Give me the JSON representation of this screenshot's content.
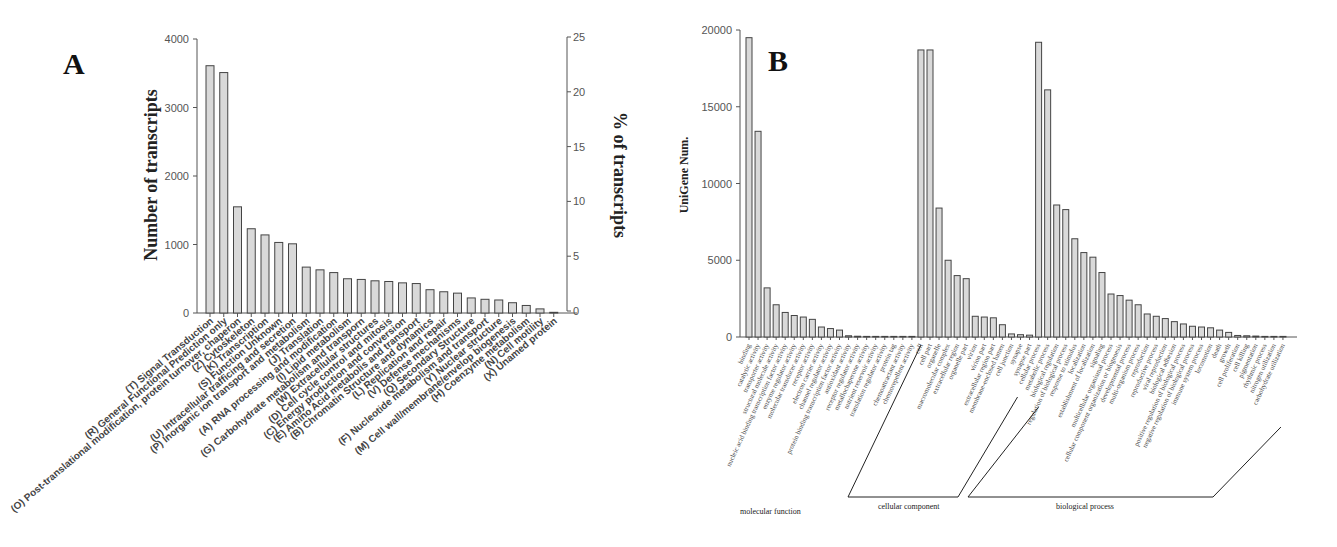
{
  "panels": {
    "a": {
      "letter": "A"
    },
    "b": {
      "letter": "B"
    }
  },
  "chart_data": [
    {
      "type": "bar",
      "panel": "A",
      "title": "",
      "xlabel": "",
      "ylabel": "Number of transcripts",
      "ylabel_right": "% of transcripts",
      "ylim": [
        0,
        4000
      ],
      "yticks": [
        0,
        1000,
        2000,
        3000,
        4000
      ],
      "ylim_right": [
        0,
        25
      ],
      "yticks_right": [
        0,
        5,
        10,
        15,
        20,
        25
      ],
      "grid": false,
      "categories": [
        "(T) Signal Transduction",
        "(R) General Functional Prediction only",
        "(O) Post-translational modification, protein turnover, chaperon",
        "(Z) Cytoskeleton",
        "(K) Transcription",
        "(S) Function Unknown",
        "(U) Intracellular trafficing and secretion",
        "(P) Inorganic ion transport and metabolism",
        "(J) Translation",
        "(A) RNA processing and modification",
        "(I) Lipid metabolism",
        "(G) Carbohydrate metabolism and transporn",
        "(W) Extracellular structures",
        "(D) Cell cycle control and mitosis",
        "(C) Energy production and conversion",
        "(E) Amino Acid metabolis and transport",
        "(B) Chromatin Structure and dynamics",
        "(L) Replication and repair",
        "(V) Defense mechanisms",
        "(Q) Secondary Structure",
        "(F) Nucleotide metabolism and transport",
        "(Y) Nuclear structure",
        "(M) Cell wall/membrane/envelop biogenesis",
        "(H) Coenzyme metabolism",
        "(N) Cell motility",
        "(X) Unamed protein"
      ],
      "values": [
        3610,
        3510,
        1550,
        1230,
        1140,
        1030,
        1010,
        670,
        630,
        590,
        500,
        490,
        470,
        460,
        440,
        430,
        340,
        310,
        290,
        220,
        200,
        190,
        150,
        110,
        60,
        10
      ]
    },
    {
      "type": "bar",
      "panel": "B",
      "title": "",
      "xlabel": "",
      "ylabel": "UniGene Num.",
      "ylim": [
        0,
        20000
      ],
      "yticks": [
        0,
        5000,
        10000,
        15000,
        20000
      ],
      "grid": false,
      "groups": [
        {
          "name": "molecular function",
          "categories": [
            "binding",
            "catalytic activity",
            "transporter activity",
            "structural molecule activity",
            "nucleic acid binding transcription factor activity",
            "enzyme regulator activity",
            "molecular transducer activity",
            "receptor activity",
            "electron carrier activity",
            "channel regulator activity",
            "protein binding transcription factor activity",
            "antioxidant activity",
            "receptor regulator activity",
            "metallochaperone activity",
            "nutrient reservoir activity",
            "translation regulator activity",
            "protein tag",
            "chemoattractant activity",
            "chemorepellent activity"
          ],
          "values": [
            19500,
            13400,
            3200,
            2100,
            1600,
            1400,
            1300,
            1150,
            650,
            550,
            450,
            80,
            50,
            10,
            10,
            10,
            10,
            5,
            5
          ]
        },
        {
          "name": "cellular component",
          "categories": [
            "cell",
            "cell part",
            "organelle",
            "macromolecular complex",
            "extracellular region",
            "organelle part",
            "virion",
            "virion part",
            "extracellular region part",
            "membrane-enclosed lumen",
            "cell junction",
            "synapse",
            "synapse part"
          ],
          "values": [
            18700,
            18700,
            8400,
            5000,
            4000,
            3800,
            1350,
            1300,
            1250,
            800,
            200,
            150,
            120
          ]
        },
        {
          "name": "biological process",
          "categories": [
            "cellular process",
            "metabolic process",
            "biological regulation",
            "regulation of biological process",
            "response to stimulus",
            "localization",
            "establishment of localization",
            "signaling",
            "multicellular organismal process",
            "cellular component organization or biogenesis",
            "developmental process",
            "multi-organism process",
            "reproduction",
            "reproductive process",
            "viral reproduction",
            "biological adhesion",
            "positive regulation of biological process",
            "negative regulation of biological process",
            "immune system process",
            "locomotion",
            "death",
            "growth",
            "cell proliferation",
            "cell killing",
            "pigmentation",
            "rhythmic process",
            "nitrogen utilization",
            "carbohydrate utilization"
          ],
          "values": [
            19200,
            16100,
            8600,
            8300,
            6400,
            5500,
            5200,
            4200,
            2800,
            2700,
            2400,
            2100,
            1500,
            1350,
            1200,
            1000,
            850,
            700,
            650,
            600,
            450,
            300,
            100,
            80,
            60,
            10,
            10,
            10
          ]
        }
      ]
    }
  ]
}
